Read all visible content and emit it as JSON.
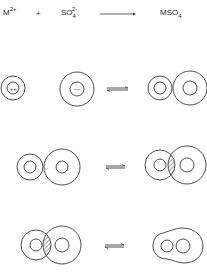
{
  "equation": {
    "cation_base": "M",
    "cation_charge": "2+",
    "plus": "+",
    "anion_base": "SO",
    "anion_subscript": "4",
    "anion_charge": "2-",
    "arrow": "forward-arrow",
    "product_base": "MSO",
    "product_subscript": "4"
  },
  "rows": [
    {
      "stage": "free-ions",
      "left": "separate cation and anion with hydration shells",
      "cation_inner_label": "++",
      "anion_inner_label": "−−",
      "arrow": "equilibrium-arrow",
      "right": "solvent-separated ion pair"
    },
    {
      "stage": "solvent-separated",
      "left": "solvent-separated ion pair",
      "arrow": "equilibrium-arrow",
      "right": "solvent-shared ion pair (overlapping shells, hatched)"
    },
    {
      "stage": "solvent-shared",
      "left": "solvent-shared ion pair (overlapping shells, hatched)",
      "arrow": "equilibrium-arrow",
      "right": "contact ion pair (merged shell)"
    }
  ],
  "colors": {
    "line": "#3a3a3a",
    "background": "#ffffff"
  }
}
